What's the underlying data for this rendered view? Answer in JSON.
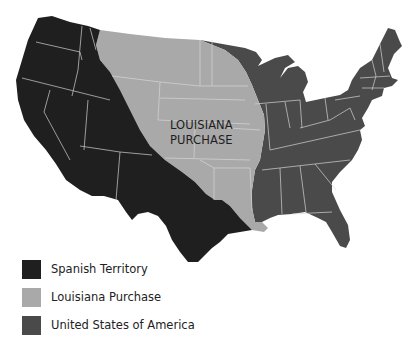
{
  "map": {
    "title": "Louisiana Purchase map of the contiguous United States",
    "region_label": {
      "line1": "LOUISIANA",
      "line2": "PURCHASE"
    },
    "colors": {
      "spanish_territory": "#1f1f1f",
      "louisiana_purchase": "#a9a9a9",
      "united_states": "#4a4a4a",
      "state_borders": "#d8d8d8",
      "background": "#ffffff"
    }
  },
  "legend": {
    "items": [
      {
        "label": "Spanish Territory",
        "color": "#1f1f1f"
      },
      {
        "label": "Louisiana Purchase",
        "color": "#a9a9a9"
      },
      {
        "label": "United States of America",
        "color": "#4a4a4a"
      }
    ]
  }
}
